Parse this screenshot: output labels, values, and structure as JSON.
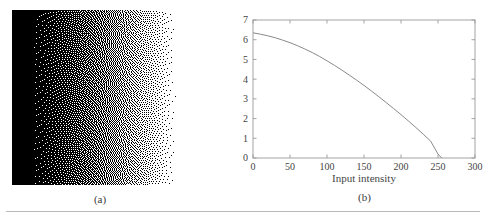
{
  "figure": {
    "background_color": "#ffffff",
    "rule_color": "#b9b9b9"
  },
  "panel_a": {
    "caption": "(a)",
    "name": "dithered-halftone-image",
    "description": "error-diffusion dithered gradient, dense black on left fading to white on right",
    "dot_color": "#000000",
    "background_color": "#ffffff"
  },
  "panel_b": {
    "caption": "(b)"
  },
  "chart_data": {
    "type": "line",
    "title": "",
    "xlabel": "Input intensity",
    "ylabel": "Output intensity",
    "xlim": [
      0,
      300
    ],
    "ylim": [
      0,
      0.7
    ],
    "xticks": [
      0,
      50,
      100,
      150,
      200,
      250,
      300
    ],
    "xticklabels": [
      "0",
      "50",
      "100",
      "150",
      "200",
      "250",
      "300"
    ],
    "yticks": [
      0,
      0.1,
      0.2,
      0.3,
      0.4,
      0.5,
      0.6,
      0.7
    ],
    "yticklabels": [
      "0",
      "0.1",
      "0.2",
      "0.3",
      "0.4",
      "0.5",
      "0.6",
      "0.7"
    ],
    "grid": false,
    "legend": null,
    "line_color": "#8a8a8a",
    "axis_color": "#9a9a9a",
    "series": [
      {
        "name": "output-intensity-curve",
        "x": [
          0,
          10,
          20,
          30,
          40,
          50,
          60,
          70,
          80,
          90,
          100,
          110,
          120,
          130,
          140,
          150,
          160,
          170,
          180,
          190,
          200,
          210,
          220,
          230,
          240,
          250,
          255
        ],
        "y": [
          0.635,
          0.628,
          0.62,
          0.61,
          0.598,
          0.585,
          0.57,
          0.553,
          0.535,
          0.515,
          0.493,
          0.47,
          0.446,
          0.421,
          0.395,
          0.368,
          0.34,
          0.311,
          0.281,
          0.251,
          0.22,
          0.188,
          0.155,
          0.121,
          0.086,
          0.02,
          0.0
        ]
      }
    ]
  }
}
